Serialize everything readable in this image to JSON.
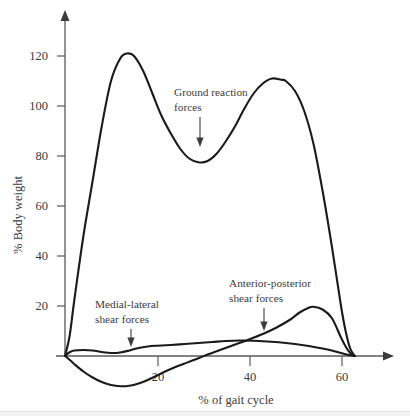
{
  "figure": {
    "background": "#ffffff",
    "curve_color": "#1a1a1a",
    "axis_color": "#58595b",
    "text_color": "#3b3b3d"
  },
  "chart_data": {
    "type": "line",
    "title": "",
    "xlabel": "% of gait cycle",
    "ylabel": "% Body weight",
    "xlim": [
      0,
      72
    ],
    "ylim": [
      -14,
      132
    ],
    "xticks": [
      20,
      40,
      60
    ],
    "xtick_labels": [
      "20",
      "40",
      "60"
    ],
    "yticks": [
      20,
      40,
      60,
      80,
      100,
      120
    ],
    "ytick_labels": [
      "20",
      "40",
      "60",
      "80",
      "100",
      "120"
    ],
    "grid": false,
    "legend": "none (inline annotations)",
    "series": [
      {
        "name": "Ground reaction forces",
        "x": [
          0,
          1,
          2,
          4,
          6,
          8,
          10,
          12,
          13.5,
          15,
          17,
          19,
          21,
          23,
          25,
          27,
          29,
          31,
          33,
          35,
          37,
          39,
          41,
          43,
          45,
          47,
          48,
          50,
          52,
          54,
          56,
          58,
          60,
          61,
          62,
          63
        ],
        "y": [
          0,
          8,
          22,
          48,
          70,
          92,
          110,
          119,
          121,
          120,
          114,
          105,
          96,
          89,
          83,
          79,
          77.5,
          78,
          81,
          86,
          92,
          99,
          105,
          109,
          111,
          110.5,
          110,
          106,
          98,
          85,
          66,
          44,
          20,
          10,
          3,
          0
        ]
      },
      {
        "name": "Medial-lateral shear forces",
        "x": [
          0,
          1,
          2,
          4,
          6,
          8,
          10,
          12,
          14,
          16,
          18,
          20,
          23,
          26,
          29,
          32,
          35,
          38,
          41,
          44,
          47,
          50,
          53,
          56,
          58,
          60,
          61,
          62,
          63
        ],
        "y": [
          0,
          1.5,
          2.2,
          2.4,
          2.2,
          1.6,
          1.2,
          1.4,
          2.2,
          3.2,
          3.8,
          4.1,
          4.4,
          4.8,
          5.2,
          5.6,
          6.0,
          6.2,
          6.1,
          5.8,
          5.4,
          4.8,
          4.0,
          3.0,
          2.2,
          1.2,
          0.7,
          0.3,
          0
        ]
      },
      {
        "name": "Anterior-posterior shear forces",
        "x": [
          0,
          1,
          2,
          4,
          6,
          8,
          10,
          12,
          14,
          16,
          18,
          20,
          22,
          24,
          26,
          28,
          31,
          34,
          37,
          40,
          43,
          46,
          49,
          51,
          53,
          54,
          56,
          58,
          60,
          61,
          62,
          63
        ],
        "y": [
          0,
          -1.5,
          -3.2,
          -6.2,
          -8.6,
          -10.4,
          -11.6,
          -12.1,
          -11.9,
          -11.0,
          -9.6,
          -7.8,
          -6.0,
          -4.4,
          -3.0,
          -1.6,
          0.6,
          2.6,
          4.6,
          6.6,
          8.8,
          11.4,
          14.6,
          17.4,
          19.3,
          19.7,
          18.6,
          15.2,
          7.4,
          3.8,
          1.2,
          0
        ]
      }
    ],
    "annotations": [
      {
        "label_line1": "Ground reaction",
        "label_line2": "forces",
        "points_to_series": "Ground reaction forces"
      },
      {
        "label_line1": "Medial-lateral",
        "label_line2": "shear forces",
        "points_to_series": "Medial-lateral shear forces"
      },
      {
        "label_line1": "Anterior-posterior",
        "label_line2": "shear forces",
        "points_to_series": "Anterior-posterior shear forces"
      }
    ]
  }
}
